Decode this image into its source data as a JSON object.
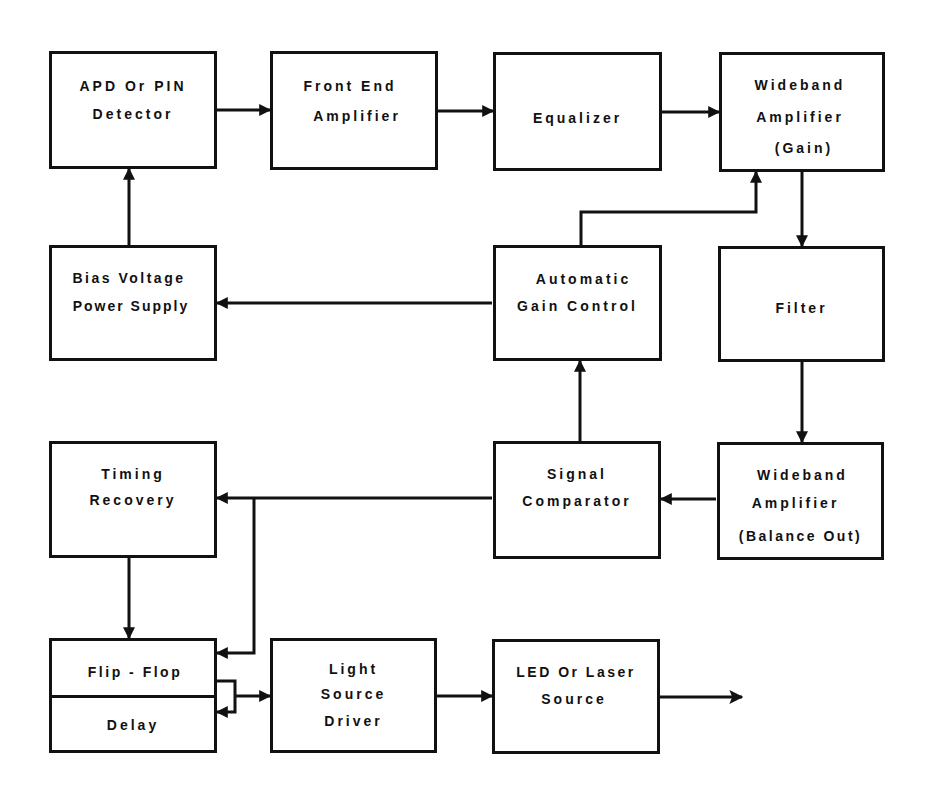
{
  "diagram": {
    "type": "block-diagram",
    "colors": {
      "stroke": "#111111",
      "background": "#ffffff"
    },
    "blocks": [
      {
        "id": "apd",
        "lines": [
          "APD Or PIN",
          "Detector"
        ]
      },
      {
        "id": "front_end",
        "lines": [
          "Front End",
          "Amplifier"
        ]
      },
      {
        "id": "equalizer",
        "lines": [
          "Equalizer"
        ]
      },
      {
        "id": "wideband_gain",
        "lines": [
          "Wideband",
          "Amplifier",
          "(Gain)"
        ]
      },
      {
        "id": "bias",
        "lines": [
          "Bias Voltage",
          "Power Supply"
        ]
      },
      {
        "id": "agc",
        "lines": [
          "Automatic",
          "Gain Control"
        ]
      },
      {
        "id": "filter",
        "lines": [
          "Filter"
        ]
      },
      {
        "id": "timing",
        "lines": [
          "Timing",
          "Recovery"
        ]
      },
      {
        "id": "comparator",
        "lines": [
          "Signal",
          "Comparator"
        ]
      },
      {
        "id": "wideband_balance",
        "lines": [
          "Wideband",
          "Amplifier",
          "(Balance Out)"
        ]
      },
      {
        "id": "flipflop",
        "lines": [
          "Flip - Flop"
        ]
      },
      {
        "id": "delay",
        "lines": [
          "Delay"
        ]
      },
      {
        "id": "driver",
        "lines": [
          "Light",
          "Source",
          "Driver"
        ]
      },
      {
        "id": "led",
        "lines": [
          "LED Or Laser",
          "Source"
        ]
      }
    ],
    "connections": [
      {
        "from": "apd",
        "to": "front_end"
      },
      {
        "from": "front_end",
        "to": "equalizer"
      },
      {
        "from": "equalizer",
        "to": "wideband_gain"
      },
      {
        "from": "wideband_gain",
        "to": "filter"
      },
      {
        "from": "filter",
        "to": "wideband_balance"
      },
      {
        "from": "wideband_balance",
        "to": "comparator"
      },
      {
        "from": "comparator",
        "to": "agc"
      },
      {
        "from": "agc",
        "to": "wideband_gain"
      },
      {
        "from": "agc",
        "to": "bias"
      },
      {
        "from": "bias",
        "to": "apd"
      },
      {
        "from": "comparator",
        "to": "timing"
      },
      {
        "from": "comparator",
        "to": "flipflop"
      },
      {
        "from": "timing",
        "to": "flipflop"
      },
      {
        "from": "flipflop",
        "to": "delay"
      },
      {
        "from": "delay",
        "to": "driver"
      },
      {
        "from": "driver",
        "to": "led"
      },
      {
        "from": "led",
        "to": "output"
      }
    ]
  }
}
